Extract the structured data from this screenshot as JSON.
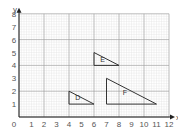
{
  "diagram": {
    "type": "coordinate-grid",
    "axes": {
      "x": {
        "label": "x",
        "min": 0,
        "max": 12,
        "ticks": [
          "0",
          "1",
          "2",
          "3",
          "4",
          "5",
          "6",
          "7",
          "8",
          "9",
          "10",
          "11",
          "12"
        ]
      },
      "y": {
        "label": "y",
        "min": 0,
        "max": 8,
        "ticks": [
          "1",
          "2",
          "3",
          "4",
          "5",
          "6",
          "7",
          "8"
        ]
      }
    },
    "grid": {
      "major_every": 2,
      "minor_per_unit": 5
    },
    "shapes": [
      {
        "name": "D",
        "type": "triangle",
        "vertices": [
          [
            4,
            1
          ],
          [
            4,
            2
          ],
          [
            6,
            1
          ]
        ],
        "label_pos": [
          4.5,
          1.3
        ]
      },
      {
        "name": "E",
        "type": "triangle",
        "vertices": [
          [
            6,
            4
          ],
          [
            6,
            5
          ],
          [
            8,
            4
          ]
        ],
        "label_pos": [
          6.5,
          4.3
        ]
      },
      {
        "name": "F",
        "type": "triangle",
        "vertices": [
          [
            7,
            1
          ],
          [
            7,
            3
          ],
          [
            11,
            1
          ]
        ],
        "label_pos": [
          8.3,
          1.7
        ]
      }
    ],
    "colors": {
      "minor_grid": "#e2e2e2",
      "major_grid": "#9a9a9a",
      "axis": "#222222",
      "shape": "#333333"
    }
  }
}
